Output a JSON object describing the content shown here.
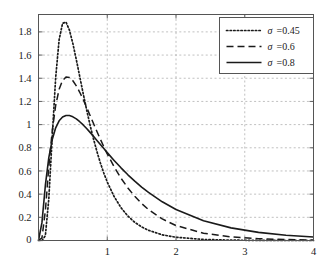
{
  "chart_data": {
    "type": "line",
    "title": "",
    "xlabel": "",
    "ylabel": "",
    "xlim": [
      0,
      4
    ],
    "ylim": [
      0,
      1.95
    ],
    "grid": true,
    "legend_position": "top-right",
    "xticks": [
      0,
      1,
      2,
      3,
      4
    ],
    "xtick_labels": [
      "0",
      "1",
      "2",
      "3",
      "4"
    ],
    "yticks": [
      0,
      0.2,
      0.4,
      0.6,
      0.8,
      1,
      1.2,
      1.4,
      1.6,
      1.8
    ],
    "ytick_labels": [
      "0",
      "0.2",
      "0.4",
      "0.6",
      "0.8",
      "1",
      "1.2",
      "1.4",
      "1.6",
      "1.8"
    ],
    "series": [
      {
        "name": "sigma-0.45",
        "legend_symbol": "σ",
        "legend_value": "=0.45",
        "sigma": 0.45,
        "style": "dotted",
        "color": "#1a1a1a",
        "peak_x": 0.37,
        "peak_y": 1.89,
        "x": [
          0,
          0.05,
          0.1,
          0.15,
          0.2,
          0.25,
          0.3,
          0.35,
          0.4,
          0.45,
          0.5,
          0.55,
          0.6,
          0.65,
          0.7,
          0.75,
          0.8,
          0.85,
          0.9,
          0.95,
          1.0,
          1.1,
          1.2,
          1.3,
          1.4,
          1.5,
          1.6,
          1.8,
          2.0,
          2.4,
          2.8,
          3.2,
          3.6,
          4.0
        ],
        "y": [
          0,
          0.0,
          0.042,
          0.359,
          0.897,
          1.407,
          1.733,
          1.874,
          1.885,
          1.815,
          1.699,
          1.561,
          1.414,
          1.268,
          1.127,
          0.996,
          0.876,
          0.767,
          0.669,
          0.582,
          0.505,
          0.379,
          0.283,
          0.211,
          0.157,
          0.117,
          0.088,
          0.049,
          0.028,
          0.009,
          0.003,
          0.001,
          0.0,
          0.0
        ]
      },
      {
        "name": "sigma-0.6",
        "legend_symbol": "σ",
        "legend_value": "=0.6",
        "sigma": 0.6,
        "style": "dashed",
        "color": "#1a1a1a",
        "peak_x": 0.45,
        "peak_y": 1.41,
        "x": [
          0,
          0.05,
          0.1,
          0.15,
          0.2,
          0.25,
          0.3,
          0.35,
          0.4,
          0.45,
          0.5,
          0.55,
          0.6,
          0.65,
          0.7,
          0.75,
          0.8,
          0.85,
          0.9,
          0.95,
          1.0,
          1.1,
          1.2,
          1.3,
          1.4,
          1.5,
          1.6,
          1.8,
          2.0,
          2.4,
          2.8,
          3.2,
          3.6,
          4.0
        ],
        "y": [
          0,
          0.022,
          0.258,
          0.636,
          0.948,
          1.166,
          1.305,
          1.381,
          1.41,
          1.406,
          1.378,
          1.334,
          1.279,
          1.216,
          1.149,
          1.079,
          1.009,
          0.94,
          0.873,
          0.809,
          0.748,
          0.636,
          0.538,
          0.453,
          0.381,
          0.319,
          0.267,
          0.186,
          0.129,
          0.063,
          0.031,
          0.016,
          0.008,
          0.004
        ]
      },
      {
        "name": "sigma-0.8",
        "legend_symbol": "σ",
        "legend_value": "=0.8",
        "sigma": 0.8,
        "style": "solid",
        "color": "#1a1a1a",
        "peak_x": 0.55,
        "peak_y": 1.075,
        "x": [
          0,
          0.05,
          0.1,
          0.15,
          0.2,
          0.25,
          0.3,
          0.35,
          0.4,
          0.45,
          0.5,
          0.55,
          0.6,
          0.65,
          0.7,
          0.75,
          0.8,
          0.85,
          0.9,
          0.95,
          1.0,
          1.1,
          1.2,
          1.3,
          1.4,
          1.5,
          1.6,
          1.8,
          2.0,
          2.4,
          2.8,
          3.2,
          3.6,
          4.0
        ],
        "y": [
          0,
          0.154,
          0.477,
          0.715,
          0.871,
          0.972,
          1.033,
          1.066,
          1.079,
          1.078,
          1.067,
          1.049,
          1.025,
          0.997,
          0.966,
          0.933,
          0.899,
          0.863,
          0.828,
          0.793,
          0.758,
          0.691,
          0.627,
          0.567,
          0.512,
          0.461,
          0.415,
          0.334,
          0.268,
          0.171,
          0.109,
          0.07,
          0.045,
          0.03
        ]
      }
    ]
  },
  "axes": {
    "frame_color": "#555555",
    "grid_color": "#b0b0b0",
    "background": "#ffffff"
  },
  "legend": {
    "border_color": "#555555",
    "background": "#ffffff",
    "entries": [
      {
        "symbol": "σ",
        "value": "=0.45",
        "style": "dotted"
      },
      {
        "symbol": "σ",
        "value": "=0.6",
        "style": "dashed"
      },
      {
        "symbol": "σ",
        "value": "=0.8",
        "style": "solid"
      }
    ]
  }
}
